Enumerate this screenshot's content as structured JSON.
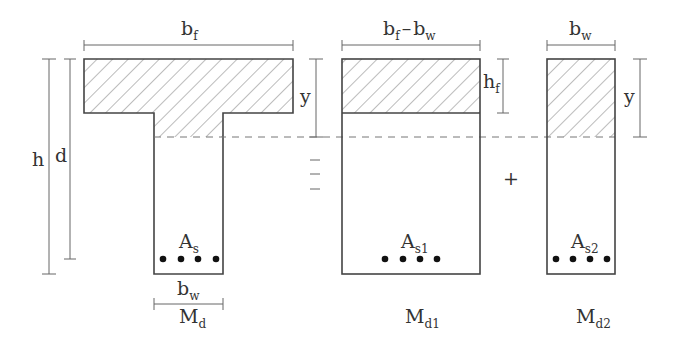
{
  "diagram": {
    "colors": {
      "outline": "#444444",
      "dimension": "#666666",
      "hatch": "#7a7a7a",
      "rebar": "#111111"
    },
    "section_full": {
      "flange_width_label": "b",
      "flange_width_sub": "f",
      "height_label": "h",
      "eff_depth_label": "d",
      "neutral_axis_label": "y",
      "steel_label": "A",
      "steel_sub": "s",
      "web_width_label": "b",
      "web_width_sub": "w",
      "moment_label": "M",
      "moment_sub": "d",
      "rebar_count": 4
    },
    "operator_equals": "=",
    "section_flange": {
      "width_label_a": "b",
      "width_sub_a": "f",
      "width_minus": "–",
      "width_label_b": "b",
      "width_sub_b": "w",
      "flange_thickness_label": "h",
      "flange_thickness_sub": "f",
      "steel_label": "A",
      "steel_sub": "s1",
      "moment_label": "M",
      "moment_sub": "d1",
      "rebar_count": 4
    },
    "operator_plus": "+",
    "section_web": {
      "width_label": "b",
      "width_sub": "w",
      "neutral_axis_label": "y",
      "steel_label": "A",
      "steel_sub": "s2",
      "moment_label": "M",
      "moment_sub": "d2",
      "rebar_count": 4
    }
  }
}
